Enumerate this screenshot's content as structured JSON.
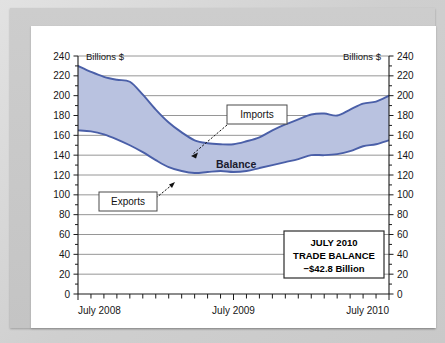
{
  "chart_data": {
    "type": "area",
    "title": "",
    "xlabel": "",
    "ylabel": "Billions $",
    "unit_left": "Billions $",
    "unit_right": "Billions $",
    "ylim": [
      0,
      240
    ],
    "ytick_step": 20,
    "yminor_step": 10,
    "grid": true,
    "legend_position": "inline-annotations",
    "yticks": [
      240,
      220,
      200,
      180,
      160,
      140,
      120,
      100,
      80,
      60,
      40,
      20,
      0
    ],
    "xtick_labels": [
      "July 2008",
      "July 2009",
      "July 2010"
    ],
    "x_months": [
      "Jul 2008",
      "Aug 2008",
      "Sep 2008",
      "Oct 2008",
      "Nov 2008",
      "Dec 2008",
      "Jan 2009",
      "Feb 2009",
      "Mar 2009",
      "Apr 2009",
      "May 2009",
      "Jun 2009",
      "Jul 2009",
      "Aug 2009",
      "Sep 2009",
      "Oct 2009",
      "Nov 2009",
      "Dec 2009",
      "Jan 2010",
      "Feb 2010",
      "Mar 2010",
      "Apr 2010",
      "May 2010",
      "Jun 2010",
      "Jul 2010"
    ],
    "series": [
      {
        "name": "Imports",
        "color": "#4a5fa8",
        "values": [
          230,
          224,
          219,
          216,
          214,
          201,
          186,
          173,
          163,
          155,
          152,
          151,
          151,
          154,
          158,
          165,
          171,
          176,
          181,
          182,
          180,
          186,
          192,
          194,
          200
        ]
      },
      {
        "name": "Exports",
        "color": "#4a5fa8",
        "values": [
          165,
          164,
          161,
          156,
          150,
          143,
          135,
          128,
          124,
          122,
          123,
          124,
          123,
          124,
          127,
          130,
          133,
          136,
          140,
          140,
          141,
          144,
          149,
          151,
          155
        ]
      }
    ],
    "band_fill": "#b9c2e0",
    "band_label": "Balance",
    "annotations": [
      {
        "id": "imports-callout",
        "text": "Imports",
        "points_to": "imports-line"
      },
      {
        "id": "exports-callout",
        "text": "Exports",
        "points_to": "exports-line"
      }
    ],
    "summary_box": {
      "line1": "JULY 2010",
      "line2": "TRADE BALANCE",
      "line3": "−$42.8 Billion"
    }
  },
  "colors": {
    "line": "#4a5fa8",
    "fill": "#b9c2e0",
    "grid": "#8a8a8a",
    "axis": "#1a1a1a",
    "panel": "#ffffff",
    "mat": "#c9c9c9"
  }
}
